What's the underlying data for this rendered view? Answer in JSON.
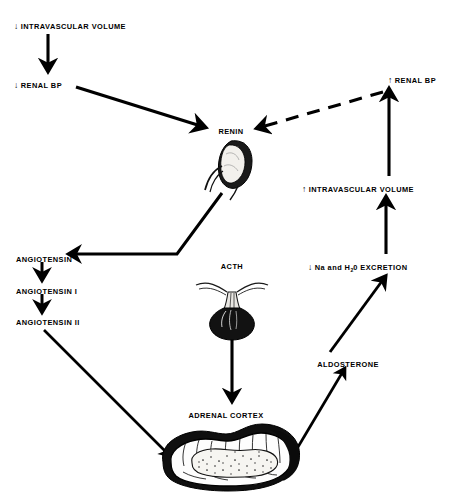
{
  "diagram": {
    "background_color": "#ffffff",
    "ink_color": "#000000",
    "width": 456,
    "height": 500
  },
  "nodes": {
    "intravascular_volume_decrease": {
      "arrow": "↓",
      "text": "INTRAVASCULAR VOLUME",
      "x": 14,
      "y": 22
    },
    "renal_bp_decrease": {
      "arrow": "↓",
      "text": "RENAL BP",
      "x": 14,
      "y": 81
    },
    "renin": {
      "text": "RENIN",
      "x": 231,
      "y": 128
    },
    "renal_bp_increase": {
      "arrow": "↑",
      "text": "RENAL BP",
      "x": 388,
      "y": 76
    },
    "intravascular_volume_increase": {
      "arrow": "↑",
      "text": "INTRAVASCULAR VOLUME",
      "x": 302,
      "y": 185
    },
    "na_h2o_excretion": {
      "arrow": "↓",
      "text_before": "Na and H",
      "subscript": "2",
      "text_after": "0 EXCRETION",
      "x": 308,
      "y": 263
    },
    "angiotensin": {
      "text": "ANGIOTENSIN",
      "x": 16,
      "y": 256
    },
    "angiotensin_i": {
      "text": "ANGIOTENSIN I",
      "x": 16,
      "y": 288
    },
    "angiotensin_ii": {
      "text": "ANGIOTENSIN II",
      "x": 16,
      "y": 319
    },
    "acth": {
      "text": "ACTH",
      "x": 232,
      "y": 263
    },
    "aldosterone": {
      "text": "ALDOSTERONE",
      "x": 348,
      "y": 361
    },
    "adrenal_cortex": {
      "text": "ADRENAL CORTEX",
      "x": 226,
      "y": 412
    }
  },
  "illustrations": {
    "kidney": {
      "name": "kidney-illustration",
      "x": 228,
      "y": 165
    },
    "pituitary": {
      "name": "pituitary-gland-illustration",
      "x": 232,
      "y": 302
    },
    "adrenal_gland": {
      "name": "adrenal-gland-illustration",
      "x": 228,
      "y": 462
    }
  },
  "connections": [
    {
      "name": "volume-to-renal-bp",
      "from": "intravascular_volume_decrease",
      "to": "renal_bp_decrease",
      "style": "solid"
    },
    {
      "name": "renal-bp-to-renin",
      "from": "renal_bp_decrease",
      "to": "renin",
      "style": "solid"
    },
    {
      "name": "renal-bp-increase-feedback-to-renin",
      "from": "renal_bp_increase",
      "to": "renin",
      "style": "dashed"
    },
    {
      "name": "renin-to-angiotensin",
      "from": "renin",
      "to": "angiotensin",
      "style": "solid"
    },
    {
      "name": "angiotensin-to-angiotensin-i",
      "from": "angiotensin",
      "to": "angiotensin_i",
      "style": "solid"
    },
    {
      "name": "angiotensin-i-to-angiotensin-ii",
      "from": "angiotensin_i",
      "to": "angiotensin_ii",
      "style": "solid"
    },
    {
      "name": "angiotensin-ii-to-adrenal-gland",
      "from": "angiotensin_ii",
      "to": "adrenal_gland",
      "style": "solid"
    },
    {
      "name": "acth-to-adrenal-cortex",
      "from": "acth",
      "to": "adrenal_cortex",
      "style": "solid"
    },
    {
      "name": "adrenal-gland-to-aldosterone",
      "from": "adrenal_gland",
      "to": "aldosterone",
      "style": "solid"
    },
    {
      "name": "aldosterone-to-na-h2o-excretion",
      "from": "aldosterone",
      "to": "na_h2o_excretion",
      "style": "solid"
    },
    {
      "name": "na-h2o-excretion-to-volume-increase",
      "from": "na_h2o_excretion",
      "to": "intravascular_volume_increase",
      "style": "solid"
    },
    {
      "name": "volume-increase-to-renal-bp-increase",
      "from": "intravascular_volume_increase",
      "to": "renal_bp_increase",
      "style": "solid"
    }
  ]
}
